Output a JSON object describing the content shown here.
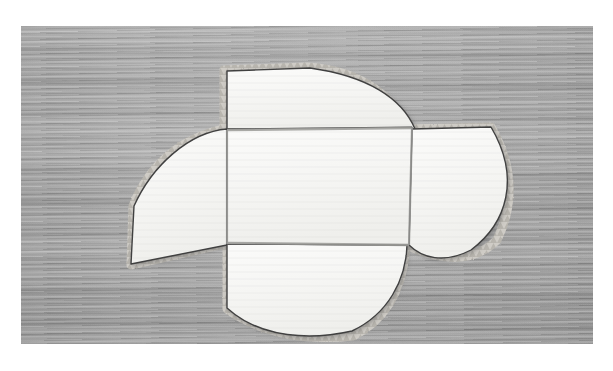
{
  "page": {
    "background_color": "#ffffff",
    "width": 613,
    "height": 371
  },
  "photo": {
    "alt_title": "White pinwheel pattern piece on wooden surface",
    "surface": "wood-grain-board",
    "surface_color": "#a9a9a9",
    "grain_direction": "horizontal",
    "frame": {
      "left": 21,
      "top": 26,
      "width": 572,
      "height": 318
    },
    "color_mode": "grayscale"
  },
  "piece": {
    "name": "pinwheel-pattern-piece",
    "material": "white-fabric",
    "fill_color": "#f7f7f5",
    "outline_color": "#3a3a3a",
    "fold_line_color": "#9a9a98",
    "edge_finish": "pinked-zigzag",
    "edge_color": "#cfcdc8",
    "center": {
      "label": "center-square",
      "x": 227,
      "y": 129,
      "width": 179,
      "height": 115
    },
    "petals": [
      {
        "label": "top-petal",
        "position": "top",
        "shape": "quarter-circle"
      },
      {
        "label": "right-petal",
        "position": "right",
        "shape": "quarter-circle"
      },
      {
        "label": "bottom-petal",
        "position": "bottom",
        "shape": "quarter-circle"
      },
      {
        "label": "left-petal",
        "position": "left",
        "shape": "quarter-circle"
      }
    ],
    "segment_count": 5,
    "symmetry": "4-fold rotational"
  },
  "caption": {
    "text": ""
  }
}
